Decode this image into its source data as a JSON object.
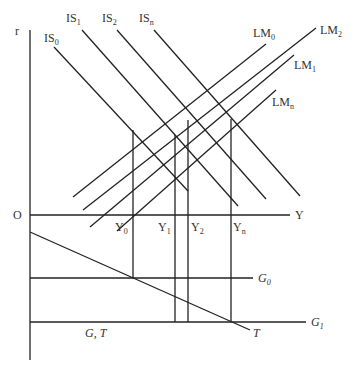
{
  "diagram": {
    "type": "IS-LM with fiscal policy (G, T) panel",
    "axes": {
      "vertical_label": "r",
      "origin_label": "O",
      "horizontal_label": "Y",
      "lower_axis_label": "G, T"
    },
    "is_curves": [
      {
        "base": "IS",
        "sub": "0"
      },
      {
        "base": "IS",
        "sub": "1"
      },
      {
        "base": "IS",
        "sub": "2"
      },
      {
        "base": "IS",
        "sub": "n"
      }
    ],
    "lm_curves": [
      {
        "base": "LM",
        "sub": "0"
      },
      {
        "base": "LM",
        "sub": "2"
      },
      {
        "base": "LM",
        "sub": "1"
      },
      {
        "base": "LM",
        "sub": "n"
      }
    ],
    "output_levels": [
      {
        "base": "Y",
        "sub": "0"
      },
      {
        "base": "Y",
        "sub": "1"
      },
      {
        "base": "Y",
        "sub": "2"
      },
      {
        "base": "Y",
        "sub": "n"
      }
    ],
    "government_lines": [
      {
        "base": "G",
        "sub": "0"
      },
      {
        "base": "G",
        "sub": "1"
      }
    ],
    "tax_line_label": "T"
  }
}
